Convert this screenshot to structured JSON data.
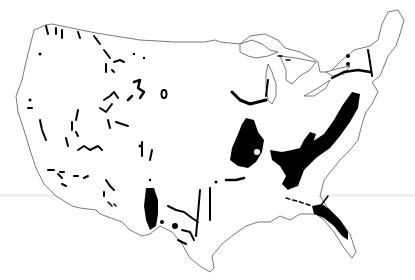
{
  "map": {
    "subject": "Contiguous United States outline with shaded black regions",
    "colors": {
      "background": "#ffffff",
      "outline": "#555555",
      "shaded_regions": "#000000"
    },
    "features": [
      "us-outline",
      "great-lakes",
      "florida-peninsula",
      "appalachian-belt",
      "central-basin-region",
      "ozark-region",
      "texas-edwards-region",
      "western-scattered-patches",
      "florida-panhandle-region"
    ]
  }
}
